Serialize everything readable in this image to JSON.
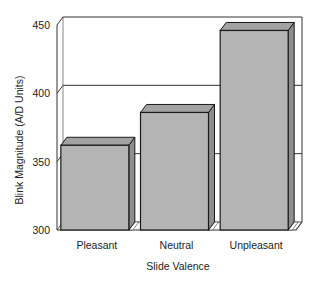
{
  "chart_data": {
    "type": "bar",
    "style": "3d",
    "title": "",
    "xlabel": "Slide Valence",
    "ylabel": "Blink Magnitude (A/D Units)",
    "categories": [
      "Pleasant",
      "Neutral",
      "Unpleasant"
    ],
    "values": [
      362,
      386,
      446
    ],
    "ylim": [
      300,
      450
    ],
    "yticks": [
      300,
      350,
      400,
      450
    ],
    "ytick_labels": [
      "300",
      "350",
      "400",
      "450"
    ],
    "grid": true,
    "legend": null
  },
  "colors": {
    "bar_front": "#b4b4b4",
    "bar_top": "#a2a2a2",
    "bar_side": "#8e8e8e",
    "outline": "#1a1a1a",
    "axis": "#333333"
  }
}
